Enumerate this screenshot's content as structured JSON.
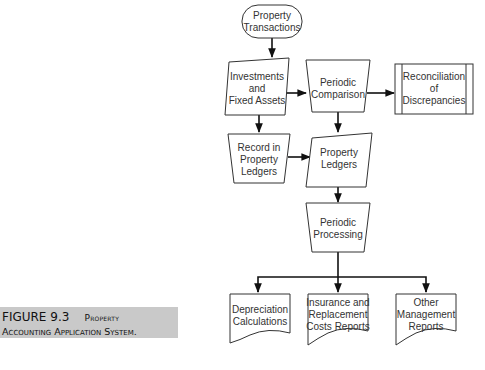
{
  "figure": {
    "number": "FIGURE 9.3",
    "title_line1": "Property",
    "title_line2": "Accounting Application System.",
    "caption_bg": "#c9c9c9"
  },
  "nodes": {
    "property_transactions": {
      "type": "terminator",
      "lines": [
        "Property",
        "Transactions"
      ]
    },
    "investments": {
      "type": "input-parallelogram",
      "lines": [
        "Investments",
        "and",
        "Fixed Assets"
      ]
    },
    "periodic_comparison": {
      "type": "manual-operation",
      "lines": [
        "Periodic",
        "Comparison"
      ]
    },
    "reconciliation": {
      "type": "predefined-process",
      "lines": [
        "Reconciliation",
        "of",
        "Discrepancies"
      ]
    },
    "record_ledgers": {
      "type": "manual-operation",
      "lines": [
        "Record in",
        "Property",
        "Ledgers"
      ]
    },
    "property_ledgers": {
      "type": "input-parallelogram",
      "lines": [
        "Property",
        "Ledgers"
      ]
    },
    "periodic_processing": {
      "type": "manual-operation",
      "lines": [
        "Periodic",
        "Processing"
      ]
    },
    "depreciation": {
      "type": "document",
      "lines": [
        "Depreciation",
        "Calculations"
      ]
    },
    "insurance": {
      "type": "document",
      "lines": [
        "Insurance and",
        "Replacement",
        "Costs Reports"
      ]
    },
    "other_reports": {
      "type": "document",
      "lines": [
        "Other",
        "Management",
        "Reports"
      ]
    }
  },
  "edges": [
    [
      "property_transactions",
      "investments"
    ],
    [
      "investments",
      "periodic_comparison"
    ],
    [
      "periodic_comparison",
      "reconciliation"
    ],
    [
      "investments",
      "record_ledgers"
    ],
    [
      "periodic_comparison",
      "property_ledgers"
    ],
    [
      "record_ledgers",
      "property_ledgers"
    ],
    [
      "property_ledgers",
      "periodic_processing"
    ],
    [
      "periodic_processing",
      "depreciation"
    ],
    [
      "periodic_processing",
      "insurance"
    ],
    [
      "periodic_processing",
      "other_reports"
    ]
  ]
}
